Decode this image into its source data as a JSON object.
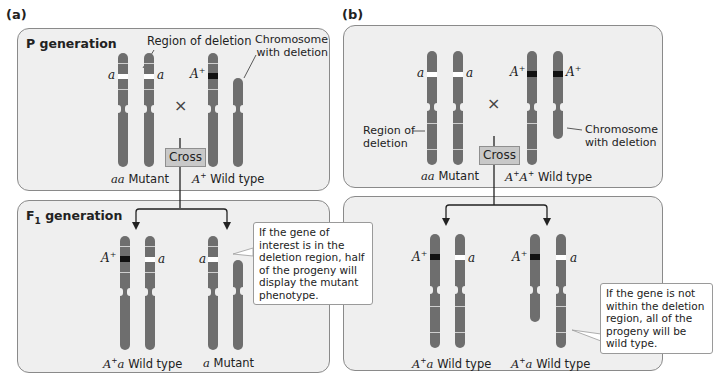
{
  "panels": [
    {
      "label": "(a)",
      "p_generation": {
        "title": "P generation",
        "annotations": {
          "region_of_deletion": "Region of deletion",
          "chromosome_with_deletion": "Chromosome\nwith deletion"
        },
        "cross_symbol": "×",
        "cross_label": "Cross",
        "parents": [
          {
            "genotype": "aa",
            "phenotype": "Mutant",
            "alleles": [
              "a",
              "a"
            ]
          },
          {
            "genotype": "A+",
            "phenotype": "Wild type",
            "alleles": [
              "A+"
            ]
          }
        ]
      },
      "f1_generation": {
        "title": "F",
        "title_sub": "1",
        "title_rest": " generation",
        "progeny": [
          {
            "genotype": "A+a",
            "phenotype": "Wild type",
            "alleles": [
              "A+",
              "a"
            ]
          },
          {
            "genotype": "a",
            "phenotype": "Mutant",
            "alleles": [
              "a"
            ]
          }
        ],
        "callout": "If the gene of interest is in the deletion region, half of the progeny will display the mutant phenotype."
      }
    },
    {
      "label": "(b)",
      "p_generation": {
        "annotations": {
          "region_of_deletion": "Region of\ndeletion",
          "chromosome_with_deletion": "Chromosome\nwith deletion"
        },
        "cross_symbol": "×",
        "cross_label": "Cross",
        "parents": [
          {
            "genotype": "aa",
            "phenotype": "Mutant",
            "alleles": [
              "a",
              "a"
            ]
          },
          {
            "genotype": "A+A+",
            "phenotype": "Wild type",
            "alleles": [
              "A+",
              "A+"
            ]
          }
        ]
      },
      "f1_generation": {
        "progeny": [
          {
            "genotype": "A+a",
            "phenotype": "Wild type",
            "alleles": [
              "A+",
              "a"
            ]
          },
          {
            "genotype": "A+a",
            "phenotype": "Wild type",
            "alleles": [
              "A+",
              "a"
            ]
          }
        ],
        "callout": "If the gene is not within the deletion region, all of the progeny will be wild type."
      }
    }
  ],
  "allele_labels": {
    "a": "a",
    "A": "A",
    "plus": "+"
  },
  "colors": {
    "chromosome": "#6e6e6e",
    "box_fill": "#efefef",
    "box_border": "#8a8a8a",
    "mutant_band": "#ffffff",
    "wild_band": "#111111",
    "cross_button": "#c8c8c8"
  }
}
